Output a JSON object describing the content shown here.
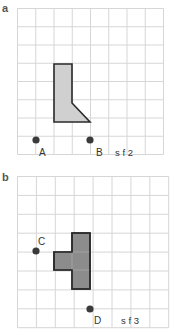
{
  "panels": [
    {
      "label": "a",
      "grid": {
        "x0": 17.5,
        "y0": 8.5,
        "cols": 8,
        "rows": 8,
        "cell": 18.25
      },
      "shape_fill": "#d0d0d0",
      "points": [
        {
          "name": "A",
          "label": "A"
        },
        {
          "name": "B",
          "label": "B"
        }
      ],
      "scale_factor": "s f 2"
    },
    {
      "label": "b",
      "grid": {
        "x0": 17.5,
        "y0": 176.5,
        "cols": 8,
        "rows": 8,
        "cell": 18.9
      },
      "shape_fill": "#8c8c8c",
      "points": [
        {
          "name": "C",
          "label": "C"
        },
        {
          "name": "D",
          "label": "D"
        }
      ],
      "scale_factor": "s f 3"
    }
  ],
  "colors": {
    "grid": "#d6d6d6",
    "outline": "#2a2a2a",
    "dot": "#3a3a3a"
  }
}
